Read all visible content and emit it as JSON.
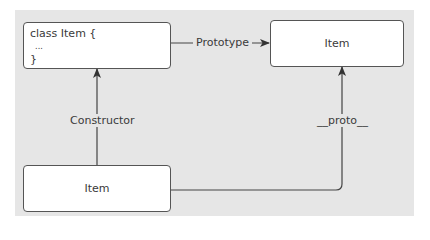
{
  "diagram": {
    "nodes": {
      "class_def": {
        "lines": [
          "class Item {",
          "  ...",
          "}"
        ]
      },
      "prototype_obj": {
        "label": "Item"
      },
      "instance": {
        "label": "Item"
      }
    },
    "edges": {
      "prototype": {
        "label": "Prototype",
        "from": "class_def",
        "to": "prototype_obj"
      },
      "constructor": {
        "label": "Constructor",
        "from": "instance",
        "to": "class_def"
      },
      "proto": {
        "label": "__proto__",
        "from": "instance",
        "to": "prototype_obj"
      }
    },
    "colors": {
      "background": "#e6e6e6",
      "box_fill": "#ffffff",
      "line": "#444444",
      "text": "#3a3a3a"
    }
  }
}
